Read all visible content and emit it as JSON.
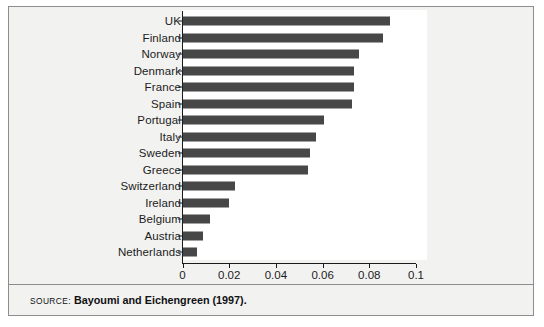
{
  "figure": {
    "source_label": "SOURCE:",
    "source_text": "Bayoumi and Eichengreen (1997)."
  },
  "chart_data": {
    "type": "bar",
    "orientation": "horizontal",
    "title": "",
    "xlabel": "",
    "ylabel": "",
    "xlim": [
      0,
      0.1
    ],
    "grid": false,
    "legend": false,
    "bar_color": "#474747",
    "plot_background": "#ffffff",
    "figure_background": "#f2f2f1",
    "xticks": [
      "0",
      "0.02",
      "0.04",
      "0.06",
      "0.08",
      "0.1"
    ],
    "xtick_values": [
      0,
      0.02,
      0.04,
      0.06,
      0.08,
      0.1
    ],
    "categories": [
      "UK",
      "Finland",
      "Norway",
      "Denmark",
      "France",
      "Spain",
      "Portugal",
      "Italy",
      "Sweden",
      "Greece",
      "Switzerland",
      "Ireland",
      "Belgium",
      "Austria",
      "Netherlands"
    ],
    "values": [
      0.089,
      0.0857,
      0.0757,
      0.0735,
      0.0733,
      0.0724,
      0.0605,
      0.0571,
      0.0544,
      0.0536,
      0.0223,
      0.0201,
      0.0116,
      0.0087,
      0.0063
    ]
  }
}
